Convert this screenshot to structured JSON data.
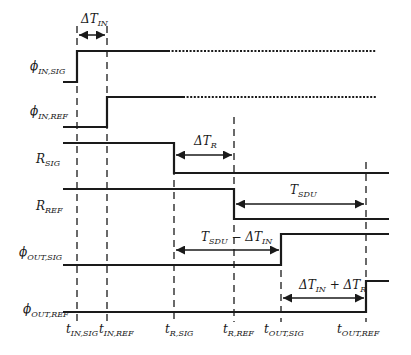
{
  "diagram": {
    "type": "timing-diagram",
    "signals": [
      {
        "id": "phi_in_sig",
        "symbol": "ϕ",
        "subscript": "IN,SIG"
      },
      {
        "id": "phi_in_ref",
        "symbol": "ϕ",
        "subscript": "IN,REF"
      },
      {
        "id": "r_sig",
        "symbol": "R",
        "subscript": "SIG"
      },
      {
        "id": "r_ref",
        "symbol": "R",
        "subscript": "REF"
      },
      {
        "id": "phi_out_sig",
        "symbol": "ϕ",
        "subscript": "OUT,SIG"
      },
      {
        "id": "phi_out_ref",
        "symbol": "ϕ",
        "subscript": "OUT,REF"
      }
    ],
    "time_markers": [
      {
        "symbol": "t",
        "subscript": "IN,SIG"
      },
      {
        "symbol": "t",
        "subscript": "IN,REF"
      },
      {
        "symbol": "t",
        "subscript": "R,SIG"
      },
      {
        "symbol": "t",
        "subscript": "R,REF"
      },
      {
        "symbol": "t",
        "subscript": "OUT,SIG"
      },
      {
        "symbol": "t",
        "subscript": "OUT,REF"
      }
    ],
    "intervals": [
      {
        "id": "dt_in",
        "main": "ΔT",
        "subscript": "IN"
      },
      {
        "id": "dt_r",
        "main": "ΔT",
        "subscript": "R"
      },
      {
        "id": "t_sdu",
        "main": "T",
        "subscript": "SDU"
      },
      {
        "id": "t_sdu_minus_dt_in",
        "a_main": "T",
        "a_sub": "SDU",
        "op": " − ",
        "b_main": "ΔT",
        "b_sub": "IN"
      },
      {
        "id": "dt_in_plus_dt_r",
        "a_main": "ΔT",
        "a_sub": "IN",
        "op": " + ",
        "b_main": "ΔT",
        "b_sub": "R"
      }
    ]
  }
}
